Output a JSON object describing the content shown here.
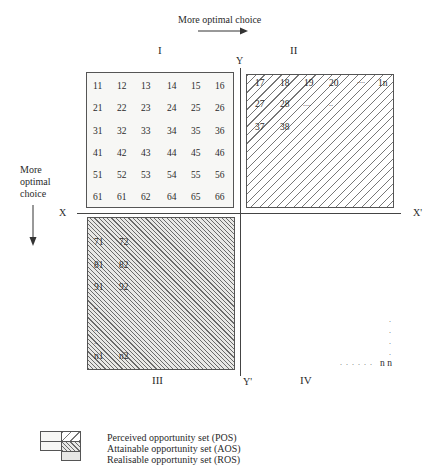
{
  "top_arrow_label": "More optimal choice",
  "left_arrow_label": [
    "More",
    "optimal",
    "choice"
  ],
  "axes": {
    "x": "X",
    "x_prime": "X'",
    "y": "Y",
    "y_prime": "Y'"
  },
  "quadrants": {
    "I": {
      "label": "I",
      "rows": [
        [
          "11",
          "12",
          "13",
          "14",
          "15",
          "16"
        ],
        [
          "21",
          "22",
          "23",
          "24",
          "25",
          "26"
        ],
        [
          "31",
          "32",
          "33",
          "34",
          "35",
          "36"
        ],
        [
          "41",
          "42",
          "43",
          "44",
          "45",
          "46"
        ],
        [
          "51",
          "52",
          "53",
          "54",
          "55",
          "56"
        ],
        [
          "61",
          "61",
          "62",
          "64",
          "65",
          "66"
        ]
      ]
    },
    "II": {
      "label": "II",
      "rows": [
        [
          "17",
          "18",
          "19",
          "20",
          "....",
          "1n"
        ],
        [
          "27",
          "28",
          "....",
          ".."
        ],
        [
          "37",
          "38"
        ]
      ]
    },
    "III": {
      "label": "III",
      "rows": [
        [
          "71",
          "72"
        ],
        [
          "81",
          "82"
        ],
        [
          "91",
          "92"
        ],
        [
          ".."
        ],
        [
          ".."
        ],
        [
          ".."
        ],
        [
          "n1",
          "n2"
        ]
      ]
    },
    "IV": {
      "label": "IV",
      "corner": "n n",
      "dots_horizontal": ". . . . . .",
      "dots_vertical": [
        ".",
        ".",
        ".",
        "."
      ]
    }
  },
  "legend": {
    "items": [
      {
        "label": "Perceived opportunity set (POS)"
      },
      {
        "label": "Attainable opportunity set (AOS)"
      },
      {
        "label": "Realisable opportunity set (ROS)"
      }
    ]
  },
  "colors": {
    "line": "#444444",
    "text": "#2a2a2a",
    "pos_fill": "#f7f7f5",
    "ros_fill": "#e8e8e6"
  }
}
